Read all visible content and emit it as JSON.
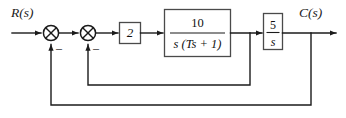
{
  "diagram": {
    "type": "control-system-block-diagram",
    "title": "",
    "input_label": "R(s)",
    "output_label": "C(s)",
    "line_color": "#1b1b1b",
    "box_border_color": "#4a4a4a",
    "background": "#ffffff",
    "summing_junctions": [
      {
        "id": "sum-1",
        "inputs": [
          "R(s)",
          "outer-feedback"
        ],
        "feedback_sign": "–",
        "style": "circle-with-cross"
      },
      {
        "id": "sum-2",
        "inputs": [
          "sum-1-output",
          "inner-feedback"
        ],
        "feedback_sign": "–",
        "style": "circle-with-cross"
      }
    ],
    "blocks": [
      {
        "id": "gain-block",
        "label": "2",
        "kind": "gain",
        "numerator": "2",
        "denominator": ""
      },
      {
        "id": "plant-block",
        "label": "10 / s(Ts + 1)",
        "kind": "transfer-function",
        "numerator": "10",
        "denominator": "s (Ts + 1)"
      },
      {
        "id": "integrator-block",
        "label": "5 / s",
        "kind": "transfer-function",
        "numerator": "5",
        "denominator": "s"
      }
    ],
    "feedback_paths": [
      {
        "id": "inner-feedback",
        "from": "plant-block-output",
        "to": "sum-2",
        "sign": "–"
      },
      {
        "id": "outer-feedback",
        "from": "integrator-block-output",
        "to": "sum-1",
        "sign": "–"
      }
    ]
  }
}
